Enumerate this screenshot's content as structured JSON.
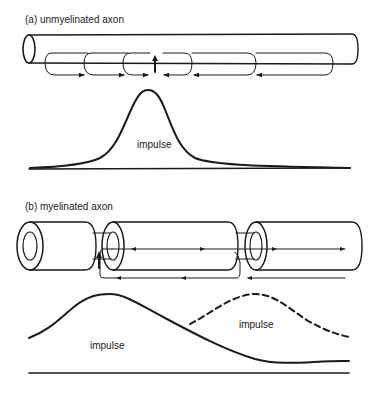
{
  "panel_a": {
    "label": "(a) unmyelinated axon",
    "impulse_label": "impulse"
  },
  "panel_b": {
    "label": "(b) myelinated axon",
    "impulse_label_solid": "impulse",
    "impulse_label_dashed": "impulse"
  },
  "colors": {
    "ink": "#1a1a1a",
    "background": "#ffffff"
  }
}
